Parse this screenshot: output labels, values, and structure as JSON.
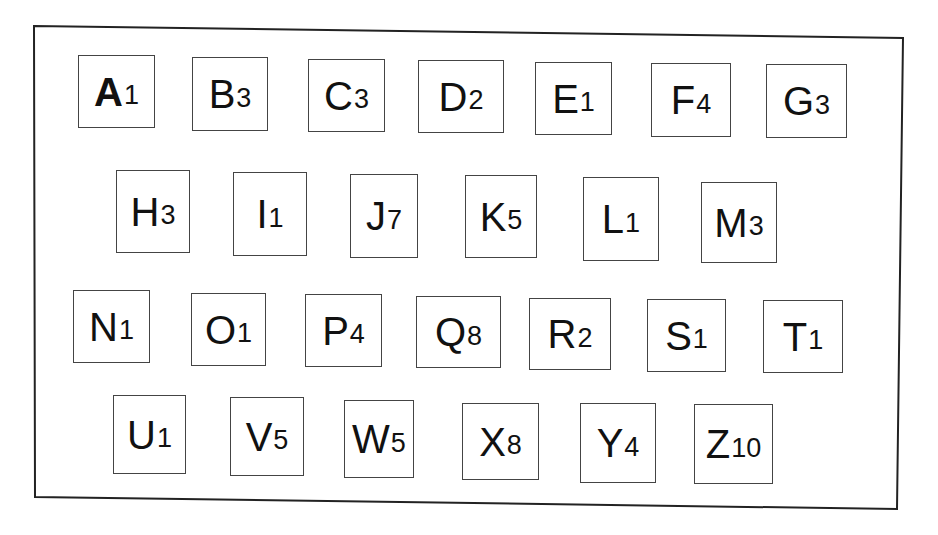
{
  "board": {
    "frame": {
      "tl": [
        34,
        26
      ],
      "tr": [
        903,
        38
      ],
      "br": [
        897,
        509
      ],
      "bl": [
        35,
        497
      ],
      "color": "#222222"
    },
    "rows": [
      {
        "tiles": [
          {
            "letter": "A",
            "value": "1",
            "bold": true,
            "box": [
              78,
              55,
              77,
              73
            ]
          },
          {
            "letter": "B",
            "value": "3",
            "bold": false,
            "box": [
              192,
              57,
              76,
              74
            ]
          },
          {
            "letter": "C",
            "value": "3",
            "bold": false,
            "box": [
              308,
              59,
              77,
              73
            ]
          },
          {
            "letter": "D",
            "value": "2",
            "bold": false,
            "box": [
              418,
              60,
              86,
              73
            ]
          },
          {
            "letter": "E",
            "value": "1",
            "bold": false,
            "box": [
              535,
              62,
              77,
              73
            ]
          },
          {
            "letter": "F",
            "value": "4",
            "bold": false,
            "box": [
              651,
              63,
              80,
              74
            ]
          },
          {
            "letter": "G",
            "value": "3",
            "bold": false,
            "box": [
              766,
              64,
              81,
              74
            ]
          }
        ]
      },
      {
        "tiles": [
          {
            "letter": "H",
            "value": "3",
            "bold": false,
            "box": [
              116,
              170,
              74,
              83
            ]
          },
          {
            "letter": "I",
            "value": "1",
            "bold": false,
            "box": [
              233,
              172,
              74,
              84
            ]
          },
          {
            "letter": "J",
            "value": "7",
            "bold": false,
            "box": [
              350,
              174,
              68,
              84
            ]
          },
          {
            "letter": "K",
            "value": "5",
            "bold": false,
            "box": [
              465,
              175,
              72,
              83
            ]
          },
          {
            "letter": "L",
            "value": "1",
            "bold": false,
            "box": [
              583,
              177,
              76,
              84
            ]
          },
          {
            "letter": "M",
            "value": "3",
            "bold": false,
            "box": [
              701,
              182,
              76,
              81
            ]
          }
        ]
      },
      {
        "tiles": [
          {
            "letter": "N",
            "value": "1",
            "bold": false,
            "box": [
              73,
              290,
              77,
              73
            ]
          },
          {
            "letter": "O",
            "value": "1",
            "bold": false,
            "box": [
              191,
              293,
              75,
              73
            ]
          },
          {
            "letter": "P",
            "value": "4",
            "bold": false,
            "box": [
              305,
              294,
              77,
              73
            ]
          },
          {
            "letter": "Q",
            "value": "8",
            "bold": false,
            "box": [
              416,
              296,
              85,
              72
            ]
          },
          {
            "letter": "R",
            "value": "2",
            "bold": false,
            "box": [
              529,
              298,
              82,
              72
            ]
          },
          {
            "letter": "S",
            "value": "1",
            "bold": false,
            "box": [
              647,
              299,
              79,
              73
            ]
          },
          {
            "letter": "T",
            "value": "1",
            "bold": false,
            "box": [
              763,
              300,
              80,
              73
            ]
          }
        ]
      },
      {
        "tiles": [
          {
            "letter": "U",
            "value": "1",
            "bold": false,
            "box": [
              113,
              395,
              73,
              79
            ]
          },
          {
            "letter": "V",
            "value": "5",
            "bold": false,
            "box": [
              230,
              397,
              74,
              79
            ]
          },
          {
            "letter": "W",
            "value": "5",
            "bold": false,
            "box": [
              344,
              400,
              70,
              78
            ]
          },
          {
            "letter": "X",
            "value": "8",
            "bold": false,
            "box": [
              462,
              403,
              77,
              77
            ]
          },
          {
            "letter": "Y",
            "value": "4",
            "bold": false,
            "box": [
              580,
              403,
              76,
              80
            ]
          },
          {
            "letter": "Z",
            "value": "10",
            "bold": false,
            "box": [
              694,
              404,
              79,
              80
            ]
          }
        ]
      }
    ]
  }
}
